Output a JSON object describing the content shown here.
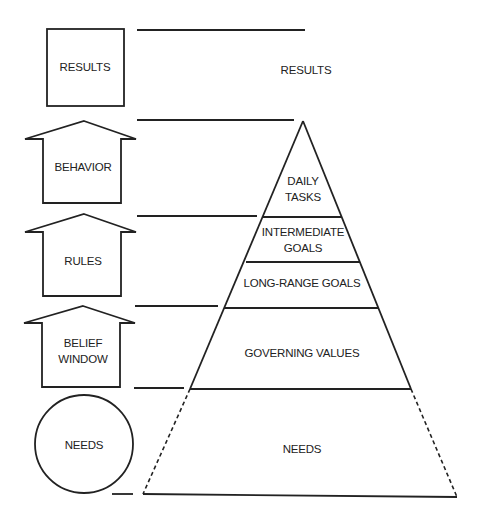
{
  "left_column": {
    "results_box": "RESULTS",
    "behavior_arrow": "BEHAVIOR",
    "rules_arrow": "RULES",
    "belief_window_arrow": {
      "line1": "BELIEF",
      "line2": "WINDOW"
    },
    "needs_circle": "NEEDS"
  },
  "pyramid": {
    "top_label": "RESULTS",
    "levels": [
      {
        "line1": "DAILY",
        "line2": "TASKS"
      },
      {
        "line1": "INTERMEDIATE",
        "line2": "GOALS"
      },
      {
        "line1": "LONG-RANGE GOALS"
      },
      {
        "line1": "GOVERNING VALUES"
      },
      {
        "line1": "NEEDS"
      }
    ]
  },
  "colors": {
    "stroke": "#222222",
    "background": "#ffffff"
  }
}
